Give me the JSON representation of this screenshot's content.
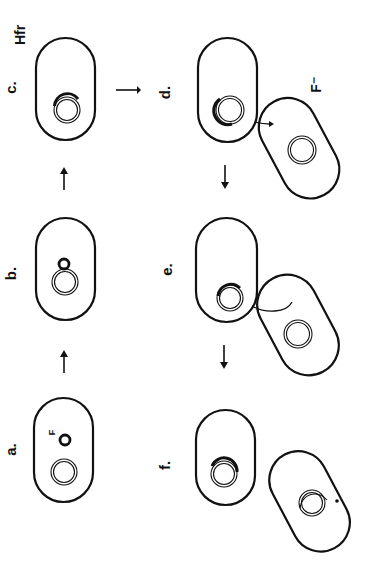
{
  "figure": {
    "orientation": "rotated 90deg counter-clockwise",
    "stroke_color": "#111111",
    "background": "#ffffff",
    "panels": [
      {
        "id": "a",
        "label": "a.",
        "description": "F+ cell with F plasmid and chromosome",
        "plasmid_label": "F"
      },
      {
        "id": "b",
        "label": "b.",
        "description": "F plasmid integrating into chromosome"
      },
      {
        "id": "c",
        "label": "c.",
        "description": "Hfr cell with integrated F",
        "cell_label": "Hfr"
      },
      {
        "id": "d",
        "label": "d.",
        "description": "Hfr conjugating with F- recipient",
        "partner_label": "F⁻"
      },
      {
        "id": "e",
        "label": "e.",
        "description": "Chromosome strand transferred into recipient"
      },
      {
        "id": "f",
        "label": "f.",
        "description": "Cells separated; recipient carries transferred segment"
      }
    ],
    "labels": {
      "a": "a.",
      "b": "b.",
      "c": "c.",
      "d": "d.",
      "e": "e.",
      "f": "f.",
      "hfr": "Hfr",
      "f_minus": "F⁻",
      "f_plasmid": "F"
    },
    "arrows": [
      {
        "from": "a",
        "to": "b",
        "glyph": "→"
      },
      {
        "from": "b",
        "to": "c",
        "glyph": "→"
      },
      {
        "from": "c",
        "to": "d",
        "glyph": "→"
      },
      {
        "from": "d",
        "to": "e",
        "glyph": "→"
      },
      {
        "from": "e",
        "to": "f",
        "glyph": "→"
      }
    ]
  }
}
